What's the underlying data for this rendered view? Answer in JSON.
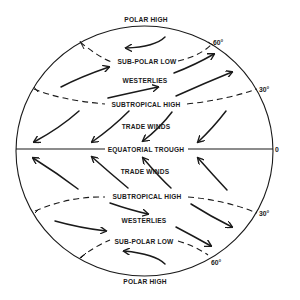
{
  "diagram": {
    "labels": {
      "north_polar_high": "POLAR HIGH",
      "north_subpolar_low": "SUB-POLAR LOW",
      "north_westerlies": "WESTERLIES",
      "north_subtropical_high": "SUBTROPICAL HIGH",
      "north_trade_winds": "TRADE WINDS",
      "equatorial_trough": "EQUATORIAL TROUGH",
      "south_trade_winds": "TRADE WINDS",
      "south_subtropical_high": "SUBTROPICAL HIGH",
      "south_westerlies": "WESTERLIES",
      "south_subpolar_low": "SUB-POLAR LOW",
      "south_polar_high": "POLAR HIGH"
    },
    "latitudes": {
      "n60": "60°",
      "n30": "30°",
      "eq": "0",
      "s30": "30°",
      "s60": "60°"
    },
    "colors": {
      "ink": "#1a1a1a",
      "background": "#ffffff"
    }
  }
}
